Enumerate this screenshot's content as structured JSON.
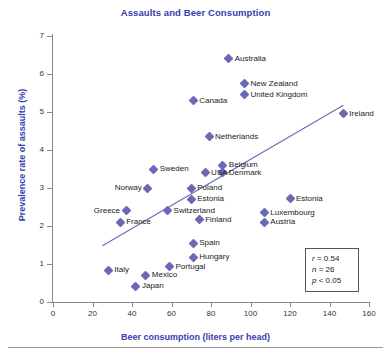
{
  "chart_data": {
    "type": "scatter",
    "title": "Assaults and Beer Consumption",
    "xlabel": "Beer consumption (liters per head)",
    "ylabel": "Prevalence rate of assaults (%)",
    "xlim": [
      0,
      160
    ],
    "ylim": [
      0,
      7
    ],
    "xticks": [
      0,
      20,
      40,
      60,
      80,
      100,
      120,
      140,
      160
    ],
    "yticks": [
      0,
      1,
      2,
      3,
      4,
      5,
      6,
      7
    ],
    "grid": false,
    "legend": "none",
    "marker": "diamond",
    "marker_color": "#6a6ab4",
    "title_color": "#3b3bb0",
    "axis_label_color": "#3b3bb0",
    "points": [
      {
        "label": "Australia",
        "x": 89,
        "y": 6.4,
        "side": "right"
      },
      {
        "label": "New Zealand",
        "x": 97,
        "y": 5.75,
        "side": "right"
      },
      {
        "label": "United Kingdom",
        "x": 97,
        "y": 5.45,
        "side": "right"
      },
      {
        "label": "Canada",
        "x": 71,
        "y": 5.3,
        "side": "right"
      },
      {
        "label": "Ireland",
        "x": 147,
        "y": 4.95,
        "side": "right"
      },
      {
        "label": "Netherlands",
        "x": 79,
        "y": 4.35,
        "side": "right"
      },
      {
        "label": "Belgium",
        "x": 86,
        "y": 3.6,
        "side": "right"
      },
      {
        "label": "Denmark",
        "x": 86,
        "y": 3.4,
        "side": "right"
      },
      {
        "label": "USA",
        "x": 77,
        "y": 3.4,
        "side": "right"
      },
      {
        "label": "Sweden",
        "x": 51,
        "y": 3.5,
        "side": "right"
      },
      {
        "label": "Norway",
        "x": 48,
        "y": 3.0,
        "side": "left"
      },
      {
        "label": "Poland",
        "x": 70,
        "y": 3.0,
        "side": "right"
      },
      {
        "label": "Estonia",
        "x": 70,
        "y": 2.7,
        "side": "right"
      },
      {
        "label": "Estonia",
        "x": 120,
        "y": 2.72,
        "side": "right"
      },
      {
        "label": "Greece",
        "x": 37,
        "y": 2.4,
        "side": "left"
      },
      {
        "label": "Switzerland",
        "x": 58,
        "y": 2.4,
        "side": "right"
      },
      {
        "label": "Luxembourg",
        "x": 107,
        "y": 2.35,
        "side": "right"
      },
      {
        "label": "Finland",
        "x": 74,
        "y": 2.17,
        "side": "right"
      },
      {
        "label": "France",
        "x": 34,
        "y": 2.1,
        "side": "right"
      },
      {
        "label": "Austria",
        "x": 107,
        "y": 2.1,
        "side": "right"
      },
      {
        "label": "Spain",
        "x": 71,
        "y": 1.55,
        "side": "right"
      },
      {
        "label": "Hungary",
        "x": 71,
        "y": 1.18,
        "side": "right"
      },
      {
        "label": "Portugal",
        "x": 59,
        "y": 0.93,
        "side": "right"
      },
      {
        "label": "Italy",
        "x": 28,
        "y": 0.83,
        "side": "right"
      },
      {
        "label": "Mexico",
        "x": 47,
        "y": 0.7,
        "side": "right"
      },
      {
        "label": "Japan",
        "x": 42,
        "y": 0.42,
        "side": "right"
      }
    ],
    "trendline": {
      "x0": 25,
      "y0": 1.48,
      "x1": 147,
      "y1": 5.18
    },
    "annotations": {
      "stats": {
        "r_symbol": "r",
        "r_value": "= 0.54",
        "n_symbol": "n",
        "n_value": "= 26",
        "p_symbol": "p",
        "p_value": "< 0.05"
      }
    }
  }
}
